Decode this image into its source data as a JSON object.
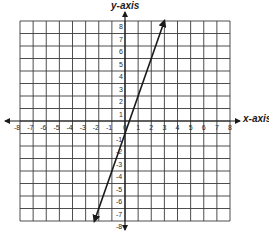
{
  "chart_data": {
    "type": "line",
    "title": "",
    "xlabel": "x-axis",
    "ylabel": "y-axis",
    "xlim": [
      -8,
      8
    ],
    "ylim": [
      -8,
      8
    ],
    "grid": true,
    "x_ticks": [
      "-8",
      "-7",
      "-6",
      "-5",
      "-4",
      "-3",
      "-2",
      "-1",
      "0",
      "1",
      "2",
      "3",
      "4",
      "5",
      "6",
      "7",
      "8"
    ],
    "y_ticks": [
      "-8",
      "-7",
      "-6",
      "-5",
      "-4",
      "-3",
      "-2",
      "-1",
      "1",
      "2",
      "3",
      "4",
      "5",
      "6",
      "7",
      "8"
    ],
    "series": [
      {
        "name": "line",
        "equation": "y = 3x - 1",
        "x": [
          -2.33,
          3
        ],
        "y": [
          -8,
          8
        ],
        "arrows_both_ends": true
      }
    ]
  },
  "labels": {
    "x_axis": "x-axis",
    "y_axis": "y-axis"
  },
  "style": {
    "grid_color": "#3a3a3a",
    "axis_color": "#1a1a1a",
    "line_color": "#1a1a1a",
    "background": "#ffffff"
  }
}
